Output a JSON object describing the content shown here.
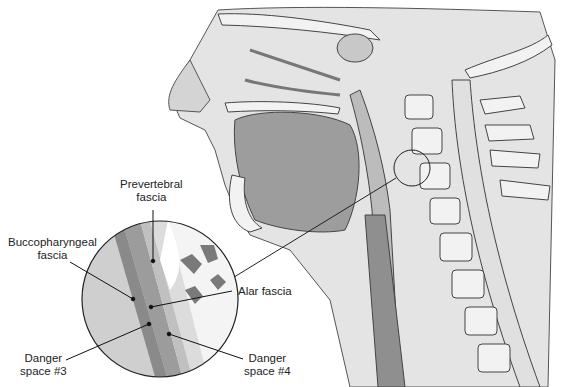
{
  "figure": {
    "labels": {
      "prevertebral": [
        "Prevertebral",
        "fascia"
      ],
      "buccopharyngeal": [
        "Buccopharyngeal",
        "fascia"
      ],
      "alar": "Alar fascia",
      "danger3": [
        "Danger",
        "space #3"
      ],
      "danger4": [
        "Danger",
        "space #4"
      ]
    },
    "colors": {
      "line": "#1a1a1a",
      "soft_tissue": "#dcdcdc",
      "muscle": "#a9a9a9",
      "bone": "#f0f0f0",
      "dark_tissue": "#7e7e7e"
    }
  }
}
